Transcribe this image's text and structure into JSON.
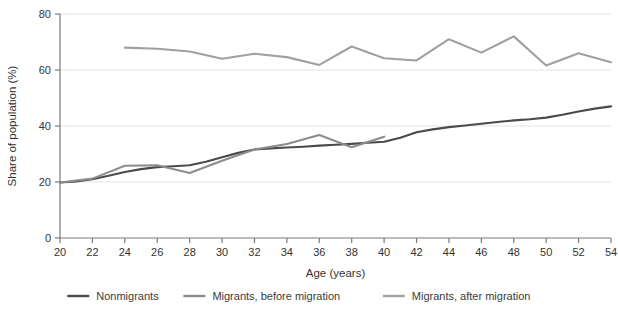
{
  "chart_data": {
    "type": "line",
    "title": "",
    "xlabel": "Age (years)",
    "ylabel": "Share of population (%)",
    "xlim": [
      20,
      54
    ],
    "ylim": [
      0,
      80
    ],
    "yticks": [
      0,
      20,
      40,
      60,
      80
    ],
    "xticks": [
      20,
      22,
      24,
      26,
      28,
      30,
      32,
      34,
      36,
      38,
      40,
      42,
      44,
      46,
      48,
      50,
      52,
      54
    ],
    "grid": "horizontal",
    "legend_position": "bottom",
    "series": [
      {
        "name": "Nonmigrants",
        "color": "#4a4a4a",
        "x": [
          20,
          21,
          22,
          23,
          24,
          25,
          26,
          27,
          28,
          29,
          30,
          31,
          32,
          33,
          34,
          35,
          36,
          37,
          38,
          39,
          40,
          41,
          42,
          43,
          44,
          45,
          46,
          47,
          48,
          49,
          50,
          51,
          52,
          53,
          54
        ],
        "values": [
          19.8,
          20.2,
          21.0,
          22.2,
          23.6,
          24.6,
          25.3,
          25.6,
          26.0,
          27.2,
          28.8,
          30.4,
          31.6,
          32.0,
          32.3,
          32.6,
          33.0,
          33.3,
          33.6,
          34.0,
          34.4,
          35.8,
          37.8,
          38.8,
          39.6,
          40.2,
          40.8,
          41.4,
          42.0,
          42.4,
          43.0,
          44.0,
          45.2,
          46.2,
          47.0
        ]
      },
      {
        "name": "Migrants, before migration",
        "color": "#8c8c8c",
        "x": [
          20,
          22,
          24,
          26,
          28,
          30,
          32,
          34,
          36,
          38,
          40
        ],
        "values": [
          19.8,
          21.2,
          25.8,
          26.0,
          23.2,
          27.6,
          31.6,
          33.6,
          36.8,
          32.4,
          36.2
        ]
      },
      {
        "name": "Migrants, after migration",
        "color": "#a0a0a0",
        "x": [
          24,
          26,
          28,
          30,
          32,
          34,
          36,
          38,
          40,
          42,
          44,
          46,
          48,
          50,
          52,
          54
        ],
        "values": [
          68.0,
          67.6,
          66.6,
          64.0,
          65.8,
          64.6,
          61.8,
          68.4,
          64.2,
          63.4,
          71.0,
          66.2,
          72.0,
          61.6,
          66.0,
          62.8
        ]
      }
    ]
  },
  "axes": {
    "ylabel": "Share of population (%)",
    "xlabel": "Age (years)"
  },
  "legend": {
    "items": [
      {
        "label": "Nonmigrants",
        "color": "#4a4a4a"
      },
      {
        "label": "Migrants, before migration",
        "color": "#8c8c8c"
      },
      {
        "label": "Migrants, after migration",
        "color": "#a0a0a0"
      }
    ]
  }
}
